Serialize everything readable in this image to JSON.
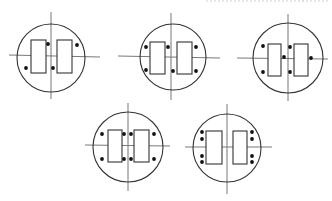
{
  "figure": {
    "width": 332,
    "height": 201,
    "stroke_color": "#333333",
    "axis_color": "#555555",
    "center_mark_color": "#aaaaaa",
    "dot_color": "#111111",
    "top_cutoff_text_segments": [
      {
        "x": 206,
        "w": 100
      },
      {
        "x": 302,
        "w": 28
      }
    ],
    "diagrams": [
      {
        "id": "layout-1",
        "circle": {
          "cx": 51,
          "cy": 58,
          "r": 34
        },
        "vline": {
          "x": 51,
          "y1": 12,
          "y2": 99
        },
        "hline": {
          "y1": 55,
          "y2": 57,
          "x1": 9,
          "x2": 100
        },
        "rects": [
          {
            "x": 31,
            "y": 40,
            "w": 15,
            "h": 33
          },
          {
            "x": 57,
            "y": 40,
            "w": 15,
            "h": 33
          }
        ],
        "dots": [
          {
            "x": 48,
            "y": 44
          },
          {
            "x": 77,
            "y": 45
          },
          {
            "x": 26,
            "y": 68
          },
          {
            "x": 53,
            "y": 68
          }
        ]
      },
      {
        "id": "layout-2",
        "circle": {
          "cx": 173,
          "cy": 57,
          "r": 33
        },
        "vline": {
          "x": 171,
          "y1": 13,
          "y2": 100
        },
        "hline": {
          "y1": 56,
          "y2": 58,
          "x1": 118,
          "x2": 220
        },
        "rects": [
          {
            "x": 150,
            "y": 42,
            "w": 15,
            "h": 32
          },
          {
            "x": 177,
            "y": 42,
            "w": 15,
            "h": 32
          }
        ],
        "dots": [
          {
            "x": 146,
            "y": 47
          },
          {
            "x": 168,
            "y": 47
          },
          {
            "x": 196,
            "y": 47
          },
          {
            "x": 146,
            "y": 70
          },
          {
            "x": 173,
            "y": 71
          },
          {
            "x": 196,
            "y": 71
          }
        ]
      },
      {
        "id": "layout-3",
        "circle": {
          "cx": 288,
          "cy": 58,
          "r": 35
        },
        "vline": {
          "x": 288,
          "y1": 14,
          "y2": 101
        },
        "hline": {
          "y1": 58,
          "y2": 59,
          "x1": 237,
          "x2": 328
        },
        "rects": [
          {
            "x": 268,
            "y": 44,
            "w": 13,
            "h": 32
          },
          {
            "x": 294,
            "y": 44,
            "w": 14,
            "h": 32
          }
        ],
        "dots": [
          {
            "x": 263,
            "y": 46
          },
          {
            "x": 290,
            "y": 47
          },
          {
            "x": 284,
            "y": 57
          },
          {
            "x": 311,
            "y": 58
          },
          {
            "x": 263,
            "y": 72
          },
          {
            "x": 290,
            "y": 72
          }
        ]
      },
      {
        "id": "layout-4",
        "circle": {
          "cx": 128,
          "cy": 147,
          "r": 35
        },
        "vline": {
          "x": 128,
          "y1": 103,
          "y2": 191
        },
        "hline": {
          "y1": 145,
          "y2": 146,
          "x1": 85,
          "x2": 170
        },
        "rects": [
          {
            "x": 108,
            "y": 130,
            "w": 14,
            "h": 32
          },
          {
            "x": 134,
            "y": 130,
            "w": 15,
            "h": 32
          }
        ],
        "dots": [
          {
            "x": 102,
            "y": 134
          },
          {
            "x": 124,
            "y": 134
          },
          {
            "x": 131,
            "y": 134
          },
          {
            "x": 154,
            "y": 134
          },
          {
            "x": 102,
            "y": 159
          },
          {
            "x": 124,
            "y": 159
          },
          {
            "x": 131,
            "y": 159
          },
          {
            "x": 154,
            "y": 159
          }
        ]
      },
      {
        "id": "layout-5",
        "circle": {
          "cx": 227,
          "cy": 148,
          "r": 34
        },
        "vline": {
          "x": 227,
          "y1": 104,
          "y2": 194
        },
        "hline": {
          "y1": 147,
          "y2": 147,
          "x1": 185,
          "x2": 272
        },
        "rects": [
          {
            "x": 206,
            "y": 131,
            "w": 16,
            "h": 33
          },
          {
            "x": 233,
            "y": 131,
            "w": 14,
            "h": 33
          }
        ],
        "dots": [
          {
            "x": 202,
            "y": 132
          },
          {
            "x": 202,
            "y": 139
          },
          {
            "x": 202,
            "y": 156
          },
          {
            "x": 202,
            "y": 162
          },
          {
            "x": 252,
            "y": 132
          },
          {
            "x": 252,
            "y": 139
          },
          {
            "x": 252,
            "y": 156
          },
          {
            "x": 252,
            "y": 162
          }
        ]
      }
    ]
  }
}
